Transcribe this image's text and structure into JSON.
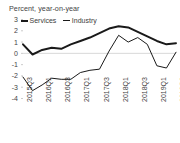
{
  "chart_data": {
    "type": "line",
    "title": "Percent, year-on-year",
    "xlabel": "",
    "ylabel": "",
    "ylim": [
      -4,
      3
    ],
    "yticks": [
      3,
      2,
      1,
      0,
      -1,
      -2,
      -3,
      -4
    ],
    "ytick_labels": [
      "3",
      "2",
      "1",
      "0",
      "-1",
      "-2",
      "-3",
      "-4"
    ],
    "grid": false,
    "zero_line": true,
    "legend_position": "top-left",
    "x": [
      "2015Q3",
      "2015Q4",
      "2016Q1",
      "2016Q2",
      "2016Q3",
      "2016Q4",
      "2017Q1",
      "2017Q2",
      "2017Q3",
      "2017Q4",
      "2018Q1",
      "2018Q2",
      "2018Q3",
      "2018Q4",
      "2019Q1",
      "2019Q2",
      "2019Q3"
    ],
    "xtick_labels": [
      "2015Q3",
      "2016Q1",
      "2016Q3",
      "2017Q1",
      "2017Q3",
      "2018Q1",
      "2018Q3",
      "2019Q1",
      "2019Q3"
    ],
    "series": [
      {
        "name": "Services",
        "color": "#1a1a1a",
        "width": 2,
        "values": [
          0.8,
          -0.1,
          0.3,
          0.5,
          0.4,
          0.8,
          1.1,
          1.4,
          1.8,
          2.2,
          2.4,
          2.3,
          1.9,
          1.5,
          1.1,
          0.8,
          0.9
        ]
      },
      {
        "name": "Industry",
        "color": "#1a1a1a",
        "width": 1,
        "values": [
          -2.1,
          -3.3,
          -2.8,
          -2.2,
          -2.3,
          -2.3,
          -1.7,
          -1.5,
          -1.4,
          0.2,
          1.6,
          1.0,
          1.4,
          0.8,
          -1.1,
          -1.3,
          0.1
        ]
      }
    ]
  }
}
